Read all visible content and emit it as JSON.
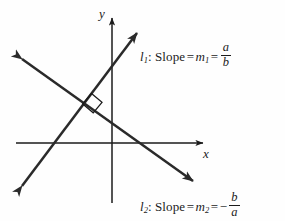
{
  "figure": {
    "type": "coordinate-diagram",
    "background_color": "#fefefe",
    "ink_color": "#1b1b1b",
    "axes": {
      "x_label": "x",
      "y_label": "y",
      "x_axis": {
        "from": [
          16,
          143
        ],
        "to": [
          207,
          143
        ],
        "arrow": "right"
      },
      "y_axis": {
        "from": [
          112,
          203
        ],
        "to": [
          112,
          14
        ],
        "arrow": "up"
      }
    },
    "lines": [
      {
        "id": "l1",
        "from": [
          15,
          195
        ],
        "to": [
          143,
          25
        ],
        "arrows": "both",
        "slope_sign": "positive",
        "y_intercept_px": 72,
        "x_intercept_px": 57
      },
      {
        "id": "l2",
        "from": [
          14,
          53
        ],
        "to": [
          200,
          186
        ],
        "arrows": "both",
        "slope_sign": "negative",
        "y_intercept_px": 123,
        "x_intercept_px": 148
      }
    ],
    "right_angle_marker": {
      "label": "right-angle",
      "intersection": [
        86,
        105
      ]
    }
  },
  "labels": {
    "line1": {
      "name": "l",
      "name_subscript": "1",
      "word": ": Slope",
      "equals": "=",
      "variable": "m",
      "variable_subscript": "1",
      "equals2": "=",
      "fraction_numerator": "a",
      "fraction_denominator": "b",
      "sign": "",
      "full_text": "l1: Slope = m1 = a/b"
    },
    "line2": {
      "name": "l",
      "name_subscript": "2",
      "word": ": Slope",
      "equals": "=",
      "variable": "m",
      "variable_subscript": "2",
      "equals2": "=",
      "sign": "−",
      "fraction_numerator": "b",
      "fraction_denominator": "a",
      "full_text": "l2: Slope = m2 = -b/a"
    }
  }
}
